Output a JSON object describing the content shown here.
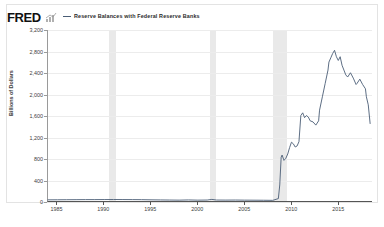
{
  "header": {
    "logo_text": "FRED",
    "logo_mark_icon": "bar-chart-icon",
    "legend_label": "Reserve Balances with Federal Reserve Banks",
    "legend_color": "#4a5d75"
  },
  "chart_data": {
    "type": "line",
    "title": "Reserve Balances with Federal Reserve Banks",
    "xlabel": "",
    "ylabel": "Billions of Dollars",
    "ylim": [
      0,
      3200
    ],
    "xlim": [
      1984,
      2018.6
    ],
    "grid": true,
    "legend_position": "top",
    "ytick_labels": [
      "3,200",
      "2,800",
      "2,400",
      "2,000",
      "1,600",
      "1,200",
      "800",
      "400",
      "0"
    ],
    "ytick_values": [
      3200,
      2800,
      2400,
      2000,
      1600,
      1200,
      800,
      400,
      0
    ],
    "xtick_labels": [
      "1985",
      "1990",
      "1995",
      "2000",
      "2005",
      "2010",
      "2015"
    ],
    "xtick_values": [
      1985,
      1990,
      1995,
      2000,
      2005,
      2010,
      2015
    ],
    "series": [
      {
        "name": "Reserve Balances with Federal Reserve Banks",
        "color": "#4a5d75",
        "units": "Billions of Dollars",
        "x": [
          1984.0,
          1985.0,
          1986.0,
          1987.0,
          1988.0,
          1989.0,
          1990.0,
          1991.0,
          1992.0,
          1993.0,
          1994.0,
          1995.0,
          1996.0,
          1997.0,
          1998.0,
          1999.0,
          2000.0,
          2001.0,
          2001.5,
          2002.0,
          2003.0,
          2004.0,
          2005.0,
          2006.0,
          2007.0,
          2008.0,
          2008.6,
          2008.75,
          2008.9,
          2009.0,
          2009.2,
          2009.4,
          2009.6,
          2009.8,
          2010.0,
          2010.2,
          2010.4,
          2010.6,
          2010.8,
          2011.0,
          2011.2,
          2011.4,
          2011.6,
          2011.8,
          2012.0,
          2012.3,
          2012.6,
          2012.9,
          2013.0,
          2013.3,
          2013.6,
          2013.9,
          2014.0,
          2014.2,
          2014.4,
          2014.6,
          2014.8,
          2015.0,
          2015.2,
          2015.4,
          2015.6,
          2015.8,
          2016.0,
          2016.3,
          2016.6,
          2016.9,
          2017.0,
          2017.3,
          2017.6,
          2017.9,
          2018.0,
          2018.2,
          2018.4
        ],
        "y": [
          22,
          23,
          24,
          25,
          26,
          26,
          27,
          28,
          27,
          26,
          25,
          22,
          20,
          18,
          16,
          20,
          16,
          18,
          30,
          18,
          17,
          18,
          16,
          15,
          14,
          12,
          45,
          300,
          820,
          860,
          760,
          800,
          880,
          1000,
          1100,
          1070,
          1010,
          1030,
          1110,
          1600,
          1650,
          1560,
          1600,
          1570,
          1500,
          1480,
          1420,
          1500,
          1700,
          1950,
          2200,
          2450,
          2600,
          2680,
          2760,
          2820,
          2700,
          2630,
          2700,
          2540,
          2450,
          2360,
          2320,
          2400,
          2300,
          2180,
          2200,
          2280,
          2180,
          2100,
          1950,
          1800,
          1450
        ]
      }
    ],
    "recession_bands": [
      {
        "start": 1990.5,
        "end": 1991.2
      },
      {
        "start": 2001.2,
        "end": 2001.9
      },
      {
        "start": 2007.95,
        "end": 2009.45
      }
    ],
    "recession_color": "#e9e9e9"
  }
}
